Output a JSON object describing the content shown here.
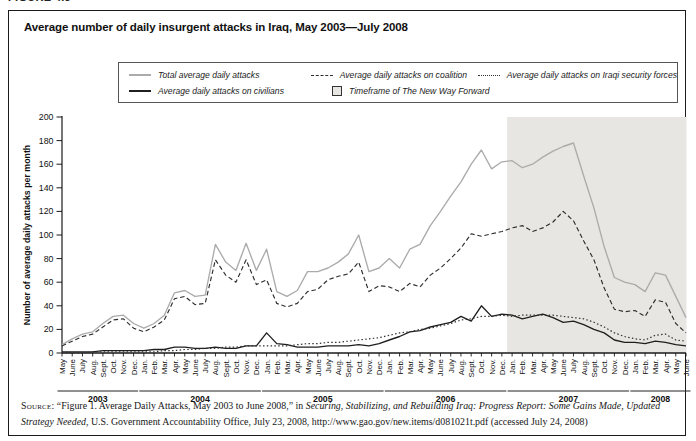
{
  "figure_label": "FIGURE 4.5",
  "title": "Average number of daily insurgent attacks in Iraq, May 2003—July 2008",
  "legend": {
    "items": [
      {
        "key": "total",
        "label": "Total average daily attacks"
      },
      {
        "key": "coalition",
        "label": "Average daily attacks on coalition"
      },
      {
        "key": "isf",
        "label": "Average daily attacks on Iraqi security forces"
      },
      {
        "key": "civilians",
        "label": "Average daily attacks on civilians"
      },
      {
        "key": "timeframe",
        "label": "Timeframe of The New Way Forward"
      }
    ]
  },
  "chart_data": {
    "type": "line",
    "title": "Average number of daily insurgent attacks in Iraq, May 2003—July 2008",
    "ylabel": "Number of average daily attacks per month",
    "ylim": [
      0,
      200
    ],
    "yticks": [
      0,
      20,
      40,
      60,
      80,
      100,
      120,
      140,
      160,
      180,
      200
    ],
    "grid": false,
    "legend_position": "top",
    "x_axis": {
      "years": [
        {
          "label": "2003",
          "months": [
            "May",
            "June",
            "July",
            "Aug.",
            "Sept.",
            "Oct.",
            "Nov.",
            "Dec."
          ]
        },
        {
          "label": "2004",
          "months": [
            "Jan.",
            "Feb.",
            "Mar.",
            "Apr.",
            "May",
            "June",
            "July",
            "Aug.",
            "Sept.",
            "Oct.",
            "Nov.",
            "Dec."
          ]
        },
        {
          "label": "2005",
          "months": [
            "Jan.",
            "Feb.",
            "Mar.",
            "Apr.",
            "May",
            "June",
            "July",
            "Aug.",
            "Sept.",
            "Oct.",
            "Nov.",
            "Dec."
          ]
        },
        {
          "label": "2006",
          "months": [
            "Jan.",
            "Feb.",
            "Mar.",
            "Apr.",
            "May",
            "June",
            "July",
            "Aug.",
            "Sept.",
            "Oct.",
            "Nov.",
            "Dec."
          ]
        },
        {
          "label": "2007",
          "months": [
            "Jan.",
            "Feb.",
            "Mar.",
            "Apr.",
            "May",
            "June",
            "July",
            "Aug.",
            "Sept.",
            "Oct.",
            "Nov.",
            "Dec."
          ]
        },
        {
          "label": "2008",
          "months": [
            "Jan.",
            "Feb.",
            "Mar.",
            "Apr.",
            "May",
            "June"
          ]
        }
      ]
    },
    "shaded_region": {
      "label": "Timeframe of The New Way Forward",
      "start": "Jan. 2007",
      "end": "June 2008",
      "color": "#e7e6e2"
    },
    "series": [
      {
        "key": "total",
        "name": "Total average daily attacks",
        "color": "#ababab",
        "style": "solid",
        "values": [
          7,
          12,
          16,
          18,
          25,
          31,
          32,
          25,
          21,
          25,
          32,
          51,
          53,
          48,
          49,
          92,
          77,
          70,
          93,
          70,
          88,
          52,
          48,
          53,
          69,
          69,
          72,
          77,
          84,
          100,
          69,
          72,
          80,
          72,
          88,
          92,
          108,
          120,
          133,
          145,
          160,
          172,
          156,
          162,
          163,
          157,
          160,
          166,
          171,
          175,
          178,
          150,
          123,
          90,
          64,
          60,
          58,
          52,
          68,
          66,
          48,
          30
        ]
      },
      {
        "key": "coalition",
        "name": "Average daily attacks on coalition",
        "color": "#2e2e2e",
        "style": "dashed",
        "values": [
          6,
          10,
          14,
          16,
          22,
          28,
          29,
          21,
          18,
          22,
          28,
          46,
          48,
          41,
          42,
          79,
          66,
          60,
          79,
          58,
          62,
          42,
          39,
          42,
          52,
          54,
          62,
          65,
          67,
          77,
          52,
          57,
          56,
          52,
          59,
          56,
          66,
          72,
          80,
          89,
          101,
          99,
          101,
          103,
          106,
          108,
          103,
          106,
          111,
          120,
          112,
          95,
          79,
          55,
          37,
          35,
          36,
          31,
          45,
          43,
          25,
          17
        ]
      },
      {
        "key": "civilians",
        "name": "Average daily attacks on civilians",
        "color": "#1f1f1f",
        "style": "solid",
        "values": [
          1,
          1,
          1,
          1,
          2,
          2,
          2,
          2,
          2,
          3,
          3,
          5,
          5,
          4,
          4,
          5,
          4,
          4,
          6,
          6,
          17,
          8,
          7,
          5,
          5,
          5,
          6,
          6,
          6,
          7,
          6,
          8,
          11,
          14,
          18,
          19,
          22,
          24,
          26,
          31,
          27,
          40,
          31,
          33,
          32,
          29,
          31,
          33,
          30,
          26,
          27,
          24,
          20,
          17,
          11,
          9,
          9,
          8,
          10,
          9,
          7,
          6
        ]
      },
      {
        "key": "isf",
        "name": "Average daily attacks on Iraqi security forces",
        "color": "#333333",
        "style": "dotted",
        "values": [
          0,
          0,
          0,
          1,
          1,
          1,
          1,
          1,
          1,
          1,
          2,
          2,
          3,
          3,
          4,
          4,
          5,
          5,
          6,
          6,
          6,
          6,
          6,
          7,
          8,
          8,
          9,
          9,
          10,
          11,
          12,
          13,
          15,
          17,
          18,
          20,
          21,
          23,
          25,
          28,
          29,
          31,
          31,
          32,
          31,
          32,
          32,
          32,
          32,
          31,
          30,
          29,
          26,
          22,
          17,
          14,
          12,
          11,
          15,
          16,
          11,
          10
        ]
      }
    ]
  },
  "source": {
    "label": "Source:",
    "part1": "“Figure 1. Average Daily Attacks, May 2003 to June 2008,” in ",
    "italic": "Securing, Stabilizing, and Rebuilding Iraq: Progress Report: Some Gains Made, Updated Strategy Needed",
    "part2": ", U.S. Government Accountability Office, July 23, 2008, http://www.gao.gov/new.items/d081021t.pdf (accessed July 24, 2008)"
  }
}
